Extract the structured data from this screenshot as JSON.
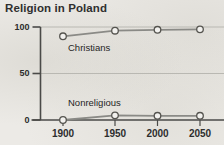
{
  "chart_data": {
    "type": "line",
    "title": "Religion in Poland",
    "xlabel": "",
    "ylabel": "",
    "x": [
      1900,
      1950,
      2000,
      2050
    ],
    "xtick_labels": [
      "1900",
      "1950",
      "2000",
      "2050"
    ],
    "ytick_labels": [
      "100",
      "50",
      "0"
    ],
    "yticks": [
      100,
      50,
      0
    ],
    "xlim": [
      1878,
      2062
    ],
    "ylim": [
      0,
      100
    ],
    "grid": true,
    "legend": "inline-labels",
    "marker": "open-circle",
    "series": [
      {
        "name": "Christians",
        "values": [
          90,
          96,
          97,
          97.5
        ],
        "color": "#8a8a86",
        "label_x": 1905,
        "label_y": 72
      },
      {
        "name": "Nonreligious",
        "values": [
          0,
          5,
          4.5,
          4.5
        ],
        "color": "#8a8a86",
        "label_x": 1905,
        "label_y": 24
      }
    ]
  },
  "style": {
    "background": "#eceae6",
    "axis_color": "#4a4a48",
    "grid_color": "#b9b8b2",
    "line_color": "#8a8a86",
    "marker_fill": "#f2f1ee",
    "marker_stroke": "#55544f",
    "text_color": "#2d2d2d",
    "title_color": "#2f2f2f"
  }
}
